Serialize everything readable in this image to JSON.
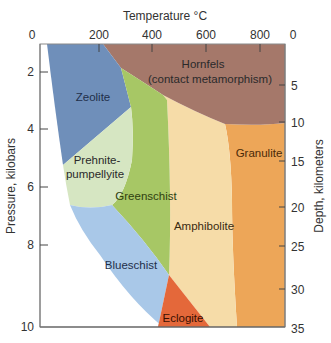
{
  "diagram": {
    "top_axis": {
      "title": "Temperature °C",
      "ticks": [
        "0",
        "200",
        "400",
        "600",
        "800"
      ],
      "right_corner_label": "0"
    },
    "left_axis": {
      "title": "Pressure, kilobars",
      "ticks": [
        "2",
        "4",
        "6",
        "8",
        "10"
      ]
    },
    "right_axis": {
      "title": "Depth, kilometers",
      "ticks": [
        "5",
        "10",
        "15",
        "20",
        "25",
        "30",
        "35"
      ]
    },
    "facies": {
      "hornfels": {
        "line1": "Hornfels",
        "line2": "(contact metamorphism)",
        "color": "#a5786a"
      },
      "zeolite": {
        "label": "Zeolite",
        "color": "#6f8fba"
      },
      "prehnite": {
        "line1": "Prehnite-",
        "line2": "pumpellyite",
        "color": "#d6e6c2"
      },
      "greenschist": {
        "label": "Greenschist",
        "color": "#a7c765"
      },
      "amphibolite": {
        "label": "Amphibolite",
        "color": "#f6dca8"
      },
      "granulite": {
        "label": "Granulite",
        "color": "#eda658"
      },
      "blueschist": {
        "label": "Blueschist",
        "color": "#a9c8e8"
      },
      "eclogite": {
        "label": "Eclogite",
        "color": "#e4683a"
      }
    }
  }
}
